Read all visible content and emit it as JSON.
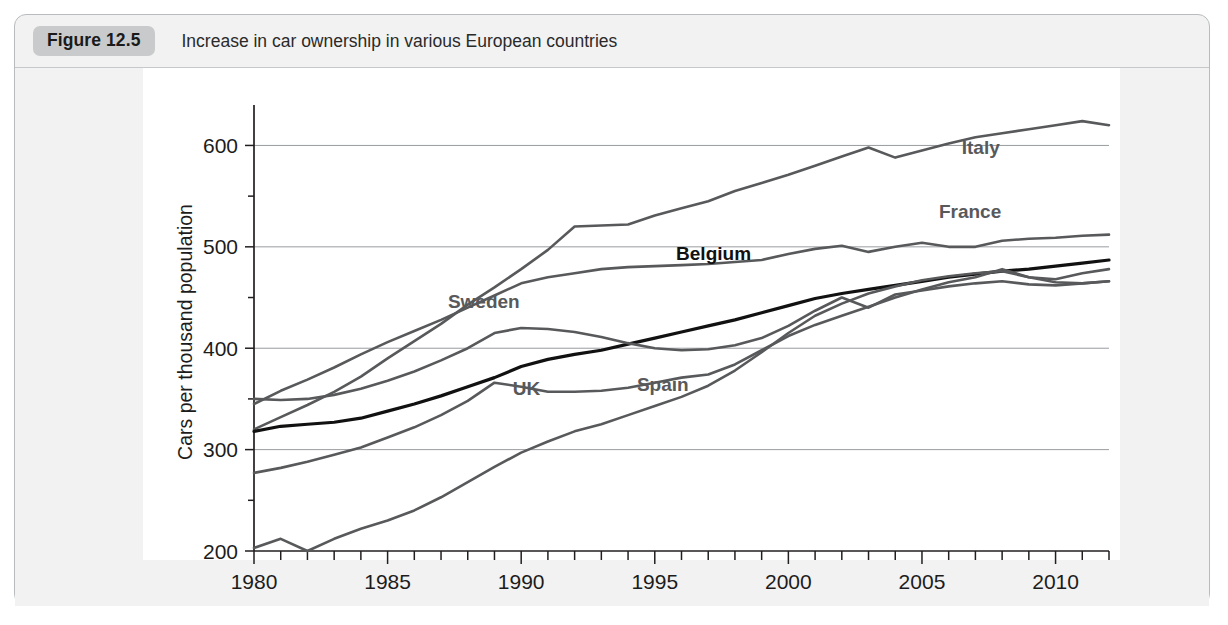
{
  "figure": {
    "badge": "Figure 12.5",
    "caption": "Increase in car ownership in various European countries"
  },
  "chart_data": {
    "type": "line",
    "title": "Increase in car ownership in various European countries",
    "xlabel": "",
    "ylabel": "Cars per thousand population",
    "xlim": [
      1980,
      2012
    ],
    "ylim": [
      200,
      632
    ],
    "xticks": [
      1980,
      1985,
      1990,
      1995,
      2000,
      2005,
      2010
    ],
    "yticks": [
      200,
      300,
      400,
      500,
      600
    ],
    "yminorticks": [
      250,
      350,
      450,
      550
    ],
    "grid": "horizontal-major",
    "legend": "inline-labels",
    "x": [
      1980,
      1981,
      1982,
      1983,
      1984,
      1985,
      1986,
      1987,
      1988,
      1989,
      1990,
      1991,
      1992,
      1993,
      1994,
      1995,
      1996,
      1997,
      1998,
      1999,
      2000,
      2001,
      2002,
      2003,
      2004,
      2005,
      2006,
      2007,
      2008,
      2009,
      2010,
      2011,
      2012
    ],
    "series": [
      {
        "name": "Italy",
        "color": "#58595b",
        "label_x": 2007.2,
        "label_y": 592,
        "values": [
          320,
          332,
          344,
          357,
          372,
          390,
          407,
          424,
          443,
          460,
          478,
          497,
          520,
          521,
          522,
          531,
          538,
          545,
          555,
          563,
          571,
          580,
          589,
          598,
          588,
          595,
          602,
          608,
          612,
          616,
          620,
          624,
          620
        ]
      },
      {
        "name": "France",
        "color": "#58595b",
        "label_x": 2006.8,
        "label_y": 528,
        "values": [
          345,
          358,
          369,
          381,
          394,
          406,
          417,
          428,
          440,
          452,
          464,
          470,
          474,
          478,
          480,
          481,
          482,
          483,
          485,
          487,
          493,
          498,
          501,
          495,
          500,
          504,
          500,
          500,
          506,
          508,
          509,
          511,
          512
        ]
      },
      {
        "name": "Belgium",
        "color": "#111111",
        "label_x": 1997.2,
        "label_y": 487,
        "values": [
          318,
          323,
          325,
          327,
          331,
          338,
          345,
          353,
          362,
          371,
          382,
          389,
          394,
          398,
          404,
          410,
          416,
          422,
          428,
          435,
          442,
          449,
          454,
          458,
          462,
          466,
          470,
          473,
          476,
          478,
          481,
          484,
          487
        ]
      },
      {
        "name": "Sweden",
        "color": "#58595b",
        "label_x": 1988.6,
        "label_y": 440,
        "values": [
          350,
          349,
          350,
          354,
          360,
          368,
          377,
          388,
          400,
          415,
          420,
          419,
          416,
          411,
          405,
          400,
          398,
          399,
          403,
          410,
          422,
          437,
          450,
          440,
          453,
          457,
          461,
          464,
          466,
          463,
          462,
          464,
          466
        ]
      },
      {
        "name": "UK",
        "color": "#58595b",
        "label_x": 1990.2,
        "label_y": 354,
        "values": [
          277,
          282,
          288,
          295,
          302,
          312,
          322,
          334,
          348,
          366,
          362,
          357,
          357,
          358,
          361,
          366,
          371,
          374,
          384,
          398,
          412,
          423,
          432,
          441,
          450,
          458,
          465,
          470,
          478,
          470,
          468,
          474,
          478
        ]
      },
      {
        "name": "Spain",
        "color": "#58595b",
        "label_x": 1995.3,
        "label_y": 358,
        "values": [
          203,
          212,
          200,
          212,
          222,
          230,
          240,
          253,
          268,
          283,
          297,
          308,
          318,
          325,
          334,
          343,
          352,
          363,
          378,
          396,
          415,
          432,
          444,
          454,
          461,
          467,
          471,
          474,
          476,
          470,
          465,
          464,
          466
        ]
      }
    ]
  }
}
